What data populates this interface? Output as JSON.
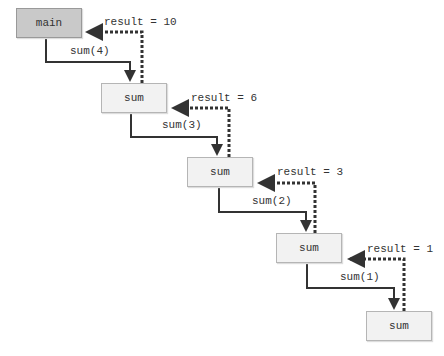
{
  "diagram": {
    "nodes": [
      {
        "id": "main",
        "label": "main"
      },
      {
        "id": "sum1",
        "label": "sum"
      },
      {
        "id": "sum2",
        "label": "sum"
      },
      {
        "id": "sum3",
        "label": "sum"
      },
      {
        "id": "sum4",
        "label": "sum"
      }
    ],
    "calls": [
      "sum(4)",
      "sum(3)",
      "sum(2)",
      "sum(1)"
    ],
    "returns": [
      "result = 10",
      "result = 6",
      "result = 3",
      "result = 1"
    ]
  }
}
